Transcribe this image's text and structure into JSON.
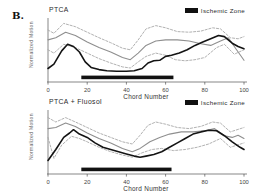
{
  "figure_label": "B.",
  "colors": {
    "background": "#ffffff",
    "band_dashed": "#a8a8a8",
    "mean_line": "#8f8f8f",
    "subject_line": "#141414",
    "axis": "#555555",
    "ischemic_bar": "#111111",
    "tick_text": "#444444"
  },
  "chart_data": [
    {
      "type": "line",
      "title": "PTCA",
      "xlabel": "Chord Number",
      "ylabel": "Normalized Motion",
      "x_ticks": [
        0,
        20,
        40,
        60,
        80,
        100
      ],
      "xlim": [
        0,
        100
      ],
      "ylim": [
        0,
        1
      ],
      "grid": false,
      "legend": [
        {
          "label": "Ischemic Zone",
          "swatch_color": "#111111"
        }
      ],
      "ischemic_zone": {
        "start": 17,
        "end": 64
      },
      "series": [
        {
          "name": "normal-range-upper",
          "style": "dashed",
          "color": "#a8a8a8",
          "width": 0.9,
          "points": [
            [
              0,
              0.8
            ],
            [
              3,
              0.74
            ],
            [
              8,
              0.92
            ],
            [
              14,
              0.86
            ],
            [
              20,
              0.76
            ],
            [
              26,
              0.66
            ],
            [
              32,
              0.57
            ],
            [
              38,
              0.47
            ],
            [
              42,
              0.44
            ],
            [
              46,
              0.62
            ],
            [
              50,
              0.82
            ],
            [
              55,
              0.88
            ],
            [
              60,
              0.84
            ],
            [
              66,
              0.77
            ],
            [
              72,
              0.76
            ],
            [
              78,
              0.78
            ],
            [
              84,
              0.84
            ],
            [
              88,
              0.82
            ],
            [
              93,
              0.66
            ],
            [
              97,
              0.64
            ],
            [
              100,
              0.68
            ]
          ]
        },
        {
          "name": "normal-mean",
          "style": "solid",
          "color": "#8f8f8f",
          "width": 1.1,
          "points": [
            [
              0,
              0.62
            ],
            [
              4,
              0.66
            ],
            [
              9,
              0.76
            ],
            [
              14,
              0.7
            ],
            [
              20,
              0.58
            ],
            [
              26,
              0.48
            ],
            [
              32,
              0.4
            ],
            [
              38,
              0.3
            ],
            [
              42,
              0.26
            ],
            [
              46,
              0.38
            ],
            [
              50,
              0.52
            ],
            [
              55,
              0.6
            ],
            [
              60,
              0.62
            ],
            [
              66,
              0.62
            ],
            [
              72,
              0.6
            ],
            [
              78,
              0.55
            ],
            [
              83,
              0.52
            ],
            [
              88,
              0.6
            ],
            [
              92,
              0.66
            ],
            [
              96,
              0.45
            ],
            [
              100,
              0.25
            ]
          ]
        },
        {
          "name": "normal-range-lower",
          "style": "dashed",
          "color": "#a8a8a8",
          "width": 0.9,
          "points": [
            [
              0,
              0.44
            ],
            [
              3,
              0.38
            ],
            [
              8,
              0.54
            ],
            [
              14,
              0.48
            ],
            [
              20,
              0.38
            ],
            [
              26,
              0.28
            ],
            [
              32,
              0.2
            ],
            [
              38,
              0.13
            ],
            [
              42,
              0.11
            ],
            [
              46,
              0.22
            ],
            [
              50,
              0.32
            ],
            [
              55,
              0.38
            ],
            [
              60,
              0.34
            ],
            [
              65,
              0.26
            ],
            [
              70,
              0.24
            ],
            [
              75,
              0.26
            ],
            [
              80,
              0.3
            ],
            [
              86,
              0.48
            ],
            [
              90,
              0.54
            ],
            [
              95,
              0.36
            ],
            [
              100,
              0.44
            ]
          ]
        },
        {
          "name": "ptca-wall-motion",
          "style": "solid",
          "color": "#141414",
          "width": 1.6,
          "points": [
            [
              0,
              0.1
            ],
            [
              3,
              0.18
            ],
            [
              7,
              0.42
            ],
            [
              10,
              0.54
            ],
            [
              13,
              0.5
            ],
            [
              16,
              0.4
            ],
            [
              19,
              0.22
            ],
            [
              22,
              0.12
            ],
            [
              26,
              0.08
            ],
            [
              30,
              0.06
            ],
            [
              35,
              0.05
            ],
            [
              40,
              0.05
            ],
            [
              44,
              0.06
            ],
            [
              48,
              0.1
            ],
            [
              51,
              0.2
            ],
            [
              54,
              0.24
            ],
            [
              57,
              0.25
            ],
            [
              60,
              0.32
            ],
            [
              63,
              0.34
            ],
            [
              67,
              0.38
            ],
            [
              71,
              0.44
            ],
            [
              75,
              0.52
            ],
            [
              79,
              0.58
            ],
            [
              83,
              0.64
            ],
            [
              87,
              0.7
            ],
            [
              90,
              0.68
            ],
            [
              94,
              0.56
            ],
            [
              97,
              0.5
            ],
            [
              100,
              0.46
            ]
          ]
        }
      ]
    },
    {
      "type": "line",
      "title": "PTCA + Fluosol",
      "xlabel": "Chord Number",
      "ylabel": "Normalized Motion",
      "x_ticks": [
        0,
        20,
        40,
        60,
        80,
        100
      ],
      "xlim": [
        0,
        100
      ],
      "ylim": [
        0,
        1
      ],
      "grid": false,
      "legend": [
        {
          "label": "Ischemic Zone",
          "swatch_color": "#111111"
        }
      ],
      "ischemic_zone": {
        "start": 17,
        "end": 63
      },
      "series": [
        {
          "name": "normal-range-upper",
          "style": "dashed",
          "color": "#a8a8a8",
          "width": 0.9,
          "points": [
            [
              0,
              0.88
            ],
            [
              4,
              0.8
            ],
            [
              9,
              0.88
            ],
            [
              14,
              0.8
            ],
            [
              20,
              0.7
            ],
            [
              26,
              0.6
            ],
            [
              32,
              0.52
            ],
            [
              38,
              0.44
            ],
            [
              43,
              0.4
            ],
            [
              47,
              0.56
            ],
            [
              51,
              0.74
            ],
            [
              55,
              0.8
            ],
            [
              60,
              0.76
            ],
            [
              66,
              0.7
            ],
            [
              72,
              0.68
            ],
            [
              78,
              0.72
            ],
            [
              84,
              0.8
            ],
            [
              88,
              0.78
            ],
            [
              93,
              0.62
            ],
            [
              100,
              0.7
            ]
          ]
        },
        {
          "name": "normal-mean",
          "style": "solid",
          "color": "#8f8f8f",
          "width": 1.1,
          "points": [
            [
              0,
              0.68
            ],
            [
              4,
              0.7
            ],
            [
              9,
              0.78
            ],
            [
              14,
              0.72
            ],
            [
              20,
              0.6
            ],
            [
              26,
              0.5
            ],
            [
              32,
              0.42
            ],
            [
              38,
              0.32
            ],
            [
              43,
              0.26
            ],
            [
              47,
              0.32
            ],
            [
              52,
              0.44
            ],
            [
              57,
              0.52
            ],
            [
              62,
              0.58
            ],
            [
              68,
              0.62
            ],
            [
              74,
              0.62
            ],
            [
              80,
              0.64
            ],
            [
              85,
              0.68
            ],
            [
              90,
              0.55
            ],
            [
              94,
              0.52
            ],
            [
              97,
              0.56
            ],
            [
              100,
              0.5
            ]
          ]
        },
        {
          "name": "normal-range-lower",
          "style": "dashed",
          "color": "#a8a8a8",
          "width": 0.9,
          "points": [
            [
              0,
              0.52
            ],
            [
              3,
              0.14
            ],
            [
              7,
              0.38
            ],
            [
              12,
              0.54
            ],
            [
              16,
              0.5
            ],
            [
              20,
              0.44
            ],
            [
              26,
              0.34
            ],
            [
              32,
              0.26
            ],
            [
              38,
              0.2
            ],
            [
              43,
              0.16
            ],
            [
              48,
              0.24
            ],
            [
              53,
              0.3
            ],
            [
              58,
              0.32
            ],
            [
              64,
              0.28
            ],
            [
              70,
              0.3
            ],
            [
              76,
              0.34
            ],
            [
              82,
              0.4
            ],
            [
              88,
              0.5
            ],
            [
              93,
              0.34
            ],
            [
              100,
              0.42
            ]
          ]
        },
        {
          "name": "ptca-fluosol-wall-motion",
          "style": "solid",
          "color": "#141414",
          "width": 1.6,
          "points": [
            [
              0,
              0.1
            ],
            [
              4,
              0.3
            ],
            [
              8,
              0.52
            ],
            [
              11,
              0.6
            ],
            [
              13,
              0.66
            ],
            [
              16,
              0.58
            ],
            [
              20,
              0.52
            ],
            [
              24,
              0.42
            ],
            [
              28,
              0.34
            ],
            [
              32,
              0.3
            ],
            [
              36,
              0.26
            ],
            [
              40,
              0.22
            ],
            [
              44,
              0.18
            ],
            [
              47,
              0.16
            ],
            [
              50,
              0.18
            ],
            [
              54,
              0.21
            ],
            [
              58,
              0.26
            ],
            [
              62,
              0.34
            ],
            [
              66,
              0.42
            ],
            [
              70,
              0.5
            ],
            [
              74,
              0.58
            ],
            [
              78,
              0.62
            ],
            [
              82,
              0.65
            ],
            [
              86,
              0.64
            ],
            [
              90,
              0.55
            ],
            [
              94,
              0.44
            ],
            [
              98,
              0.34
            ],
            [
              100,
              0.3
            ]
          ]
        }
      ]
    }
  ]
}
